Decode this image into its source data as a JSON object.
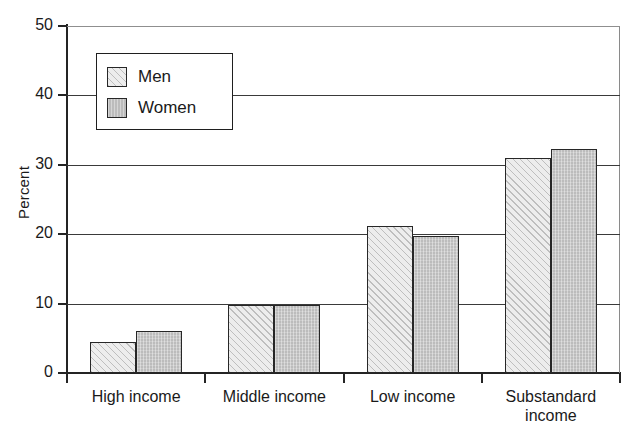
{
  "chart_data": {
    "type": "bar",
    "title": "",
    "xlabel": "",
    "ylabel": "Percent",
    "ylim": [
      0,
      50
    ],
    "yticks": [
      0,
      10,
      20,
      30,
      40,
      50
    ],
    "grid": true,
    "legend_position": "upper-left-inside",
    "categories": [
      "High income",
      "Middle income",
      "Low income",
      "Substandard income"
    ],
    "category_label_lines": [
      [
        "High income"
      ],
      [
        "Middle income"
      ],
      [
        "Low income"
      ],
      [
        "Substandard",
        "income"
      ]
    ],
    "series": [
      {
        "name": "Men",
        "values": [
          4.4,
          9.8,
          21.2,
          31.0
        ],
        "color": "#ededed",
        "pattern": "diagonal-hatch"
      },
      {
        "name": "Women",
        "values": [
          6.0,
          9.8,
          19.7,
          32.3
        ],
        "color": "#bcbcbc",
        "pattern": "solid-gray"
      }
    ]
  },
  "legend": {
    "items": [
      {
        "label": "Men"
      },
      {
        "label": "Women"
      }
    ]
  },
  "colors": {
    "men_fill": "#ededed",
    "women_fill": "#bcbcbc",
    "bar_outline": "#272727",
    "axis": "#242424",
    "gridline": "#3a3a3a",
    "background": "#ffffff"
  }
}
